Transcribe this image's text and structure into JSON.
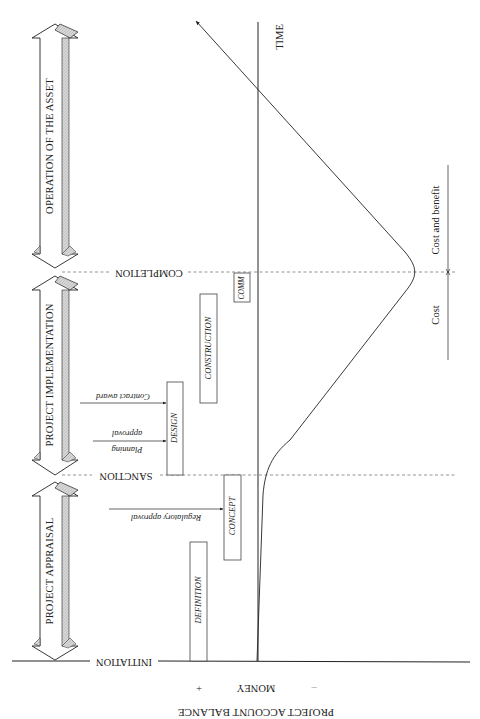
{
  "diagram": {
    "type": "project-lifecycle-money-time",
    "phases": [
      {
        "label": "OPERATION OF THE ASSET"
      },
      {
        "label": "PROJECT IMPLEMENTATION"
      },
      {
        "label": "PROJECT APPRAISAL"
      }
    ],
    "milestones": [
      {
        "label": "COMPLETION"
      },
      {
        "label": "SANCTION"
      },
      {
        "label": "INITIATION"
      }
    ],
    "stages": [
      {
        "label": "DEFINITION"
      },
      {
        "label": "CONCEPT"
      },
      {
        "label": "DESIGN"
      },
      {
        "label": "CONSTRUCTION"
      },
      {
        "label": "COMM"
      }
    ],
    "events": [
      {
        "label": "Regulatory approval"
      },
      {
        "label_line1": "Planning",
        "label_line2": "approval"
      },
      {
        "label": "Contract award"
      }
    ],
    "axes": {
      "time_label": "TIME",
      "money_label": "MONEY",
      "money_plus": "+",
      "money_minus": "–",
      "balance_label": "PROJECT ACCOUNT BALANCE"
    },
    "ranges": {
      "cost": "Cost",
      "cost_and_benefit": "Cost and benefit"
    },
    "colors": {
      "ink": "#222222",
      "arrow_shade": "#d4d4d4",
      "dash": "#666666"
    }
  }
}
